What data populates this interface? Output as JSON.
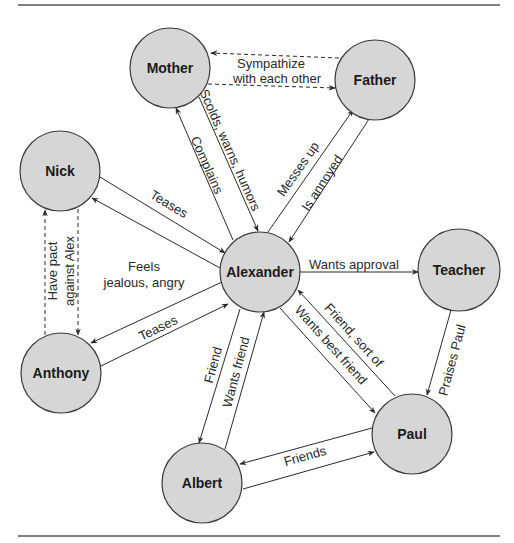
{
  "diagram": {
    "title": "",
    "nodes": [
      {
        "id": "mother",
        "label": "Mother",
        "cx": 170,
        "cy": 68
      },
      {
        "id": "father",
        "label": "Father",
        "cx": 375,
        "cy": 80
      },
      {
        "id": "nick",
        "label": "Nick",
        "cx": 60,
        "cy": 171
      },
      {
        "id": "alexander",
        "label": "Alexander",
        "cx": 260,
        "cy": 272
      },
      {
        "id": "teacher",
        "label": "Teacher",
        "cx": 459,
        "cy": 270
      },
      {
        "id": "anthony",
        "label": "Anthony",
        "cx": 61,
        "cy": 373
      },
      {
        "id": "paul",
        "label": "Paul",
        "cx": 412,
        "cy": 434
      },
      {
        "id": "albert",
        "label": "Albert",
        "cx": 202,
        "cy": 483
      }
    ],
    "node_radius": 40,
    "edges": [
      {
        "from": "father",
        "to": "mother",
        "style": "dashed",
        "label": ""
      },
      {
        "from": "mother",
        "to": "father",
        "style": "dashed",
        "label": ""
      },
      {
        "from": "mother",
        "to": "alexander",
        "style": "solid",
        "label": "Scolds, warns, humors"
      },
      {
        "from": "alexander",
        "to": "mother",
        "style": "solid",
        "label": "Complains"
      },
      {
        "from": "alexander",
        "to": "father",
        "style": "solid",
        "label": "Messes up"
      },
      {
        "from": "father",
        "to": "alexander",
        "style": "solid",
        "label": "Is annoyed"
      },
      {
        "from": "nick",
        "to": "alexander",
        "style": "solid",
        "label": "Teases"
      },
      {
        "from": "alexander",
        "to": "nick",
        "style": "solid",
        "label": ""
      },
      {
        "from": "anthony",
        "to": "nick",
        "style": "dashed",
        "label": ""
      },
      {
        "from": "nick",
        "to": "anthony",
        "style": "dashed",
        "label": ""
      },
      {
        "from": "alexander",
        "to": "anthony",
        "style": "solid",
        "label": ""
      },
      {
        "from": "anthony",
        "to": "alexander",
        "style": "solid",
        "label": "Teases"
      },
      {
        "from": "alexander",
        "to": "teacher",
        "style": "solid",
        "label": "Wants approval"
      },
      {
        "from": "teacher",
        "to": "paul",
        "style": "solid",
        "label": "Praises Paul"
      },
      {
        "from": "paul",
        "to": "alexander",
        "style": "solid",
        "label": "Friend, sort of"
      },
      {
        "from": "alexander",
        "to": "paul",
        "style": "solid",
        "label": "Wants best friend"
      },
      {
        "from": "alexander",
        "to": "albert",
        "style": "solid",
        "label": "Friend"
      },
      {
        "from": "albert",
        "to": "alexander",
        "style": "solid",
        "label": "Wants friend"
      },
      {
        "from": "paul",
        "to": "albert",
        "style": "solid",
        "label": ""
      },
      {
        "from": "albert",
        "to": "paul",
        "style": "solid",
        "label": "Friends"
      }
    ],
    "labels": {
      "sympathize_line1": "Sympathize",
      "sympathize_line2": "with each other",
      "scolds": "Scolds, warns, humors",
      "complains": "Complains",
      "messes_up": "Messes up",
      "is_annoyed": "Is annoyed",
      "nick_teases": "Teases",
      "pact_line1": "Have pact",
      "pact_line2": "against Alex",
      "feels_line1": "Feels",
      "feels_line2": "jealous, angry",
      "anthony_teases": "Teases",
      "wants_approval": "Wants approval",
      "praises_paul": "Praises Paul",
      "friend_sort_of": "Friend, sort of",
      "wants_best_friend": "Wants best friend",
      "friend": "Friend",
      "wants_friend": "Wants friend",
      "friends": "Friends"
    }
  }
}
